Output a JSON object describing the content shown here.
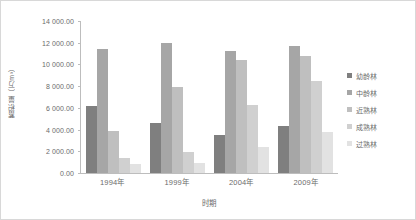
{
  "chart_data": {
    "type": "bar",
    "title": "",
    "subtitle": "",
    "xlabel": "时期",
    "ylabel": "蓄积量（万m³）",
    "categories": [
      "1994年",
      "1999年",
      "2004年",
      "2009年"
    ],
    "series": [
      {
        "name": "幼龄林",
        "color": "#7f7f7f",
        "values": [
          6200,
          4600,
          3500,
          4300
        ]
      },
      {
        "name": "中龄林",
        "color": "#a6a6a6",
        "values": [
          11400,
          11950,
          11200,
          11700
        ]
      },
      {
        "name": "近熟林",
        "color": "#bfbfbf",
        "values": [
          3900,
          7900,
          10400,
          10800
        ]
      },
      {
        "name": "成熟林",
        "color": "#d0d0d0",
        "values": [
          1400,
          1900,
          6300,
          8500
        ]
      },
      {
        "name": "过熟林",
        "color": "#e2e2e2",
        "values": [
          800,
          900,
          2400,
          3800
        ]
      }
    ],
    "ylim": [
      0,
      14000
    ],
    "ytick_step": 2000,
    "ytick_labels": [
      "0.00",
      "2 000.00",
      "4 000.00",
      "6 000.00",
      "8 000.00",
      "10 000.00",
      "12 000.00",
      "14 000.00"
    ],
    "ytick_values": [
      0,
      2000,
      4000,
      6000,
      8000,
      10000,
      12000,
      14000
    ],
    "grid": false,
    "legend_position": "right",
    "axis_color": "#bdbdbd",
    "text_color": "#6b6b6b",
    "background": "#ffffff",
    "border_color": "#d8d8d8"
  }
}
